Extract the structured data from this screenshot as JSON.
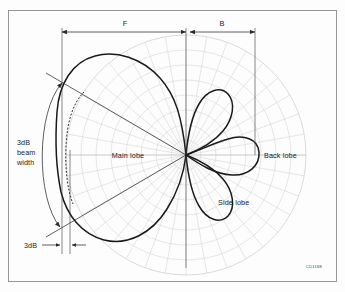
{
  "figure": {
    "code_label": "CD1188",
    "frame_color": "#8a8a8a",
    "grid_color": "#c9c9c9",
    "curve_color": "#1a1a1a"
  },
  "labels": {
    "main_lobe": "Main lobe",
    "back_lobe": "Back lobe",
    "side_lobe": "Side lobe",
    "front_dimension": "F",
    "back_dimension": "B",
    "beamwidth_line1": "3dB",
    "beamwidth_line2": "beam",
    "beamwidth_line3": "width",
    "three_db": "3dB"
  },
  "chart_data": {
    "type": "line",
    "plot_style": "polar",
    "xlabel": "",
    "ylabel": "",
    "grid": true,
    "legend_position": "none",
    "center": {
      "x": 186,
      "y": 155
    },
    "outer_radius": 120,
    "ring_count": 8,
    "radial_spoke_count": 36,
    "annotations": [
      {
        "name": "main-lobe",
        "text": "Main lobe",
        "x": 128,
        "y": 156,
        "anchor": "middle"
      },
      {
        "name": "back-lobe",
        "text": "Back lobe",
        "x": 262,
        "y": 155,
        "anchor": "start"
      },
      {
        "name": "side-lobe",
        "text": "Side lobe",
        "x": 218,
        "y": 203,
        "anchor": "start"
      },
      {
        "name": "front-dimension",
        "text": "F",
        "x": 125,
        "y": 22,
        "anchor": "middle"
      },
      {
        "name": "back-dimension",
        "text": "B",
        "x": 220,
        "y": 22,
        "anchor": "middle"
      },
      {
        "name": "beamwidth",
        "text": "3dB beam width",
        "x": 18,
        "y": 148,
        "anchor": "start"
      },
      {
        "name": "three-db-offset",
        "text": "3dB",
        "x": 24,
        "y": 245,
        "anchor": "start"
      }
    ],
    "series": [
      {
        "name": "main-lobe",
        "description": "Large forward lobe pointing left (180 deg), peak normalized amplitude 1.0",
        "peak_direction_deg": 180,
        "peak_amplitude": 1.0
      },
      {
        "name": "upper-side-lobe",
        "description": "Upper side lobe pointing up-right, peak amplitude approx 0.45",
        "peak_direction_deg": 60,
        "peak_amplitude": 0.45
      },
      {
        "name": "lower-side-lobe",
        "description": "Lower side lobe pointing down-right, peak amplitude approx 0.45",
        "peak_direction_deg": -60,
        "peak_amplitude": 0.45
      },
      {
        "name": "back-lobe",
        "description": "Back lobe pointing right (0 deg), peak amplitude approx 0.55",
        "peak_direction_deg": 0,
        "peak_amplitude": 0.55
      }
    ],
    "markers": {
      "three_db_contour": "dashed arc inside main lobe indicating half-power level",
      "beamwidth_arc": "double-headed curved arrow spanning the 3dB beam width angle",
      "beamwidth_rays": "two straight lines from origin bounding the 3dB beam width"
    }
  }
}
